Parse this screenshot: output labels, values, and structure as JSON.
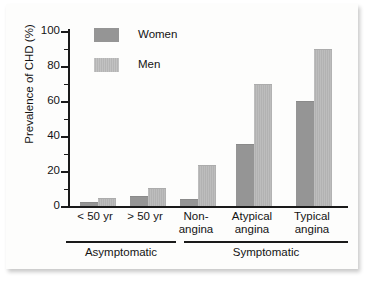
{
  "chart_data": {
    "type": "bar",
    "title": "",
    "subtitle": "",
    "xlabel": "",
    "ylabel": "Prevalence of CHD (%)",
    "ylim": [
      0,
      100
    ],
    "ytick_labels": [
      "0",
      "20",
      "40",
      "60",
      "80",
      "100"
    ],
    "ytick_values": [
      0,
      20,
      40,
      60,
      80,
      100
    ],
    "yminor_values": [
      10,
      30,
      50,
      70,
      90
    ],
    "grid": false,
    "legend_position": "top-left-inside",
    "categories": [
      "< 50 yr",
      "> 50 yr",
      "Non-angina",
      "Atypical angina",
      "Typical angina"
    ],
    "category_lines": [
      [
        "< 50 yr"
      ],
      [
        "> 50 yr"
      ],
      [
        "Non-",
        "angina"
      ],
      [
        "Atypical",
        "angina"
      ],
      [
        "Typical",
        "angina"
      ]
    ],
    "series": [
      {
        "name": "Women",
        "color": "#959595",
        "values": [
          1.5,
          5,
          3.5,
          35,
          59.5
        ]
      },
      {
        "name": "Men",
        "color": "#b9b9b9",
        "values": [
          4,
          10,
          23,
          69,
          89
        ]
      }
    ],
    "groups": [
      {
        "label": "Asymptomatic",
        "categories": [
          "< 50 yr",
          "> 50 yr"
        ]
      },
      {
        "label": "Symptomatic",
        "categories": [
          "Non-angina",
          "Atypical angina",
          "Typical angina"
        ]
      }
    ],
    "annotations": []
  },
  "legend": {
    "items": [
      {
        "label": "Women",
        "swatch": "women-swatch"
      },
      {
        "label": "Men",
        "swatch": "men-swatch"
      }
    ]
  }
}
